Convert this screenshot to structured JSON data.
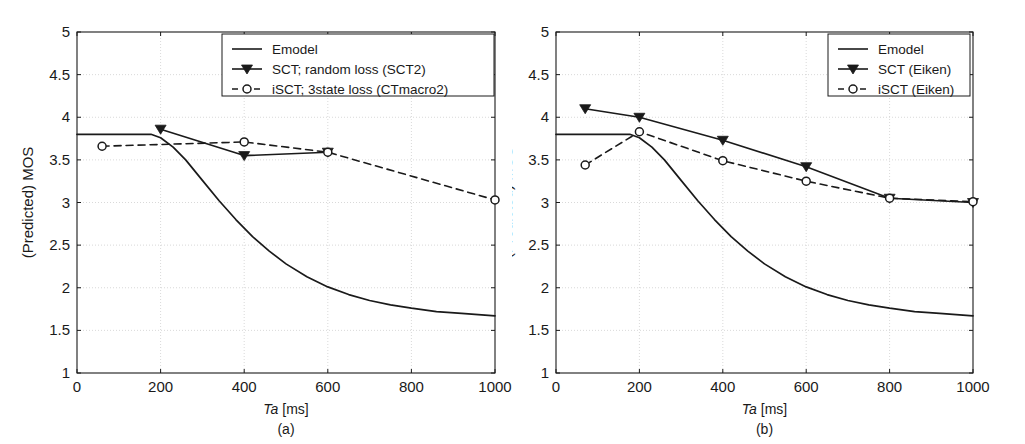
{
  "figure": {
    "background": "#ffffff",
    "ink": "#1a1a1a",
    "grid_color": "#cfcfcf",
    "panels": [
      "a",
      "b"
    ]
  },
  "panel_a": {
    "caption": "(a)",
    "xlabel_italic": "Ta",
    "xlabel_rest": " [ms]",
    "ylabel": "(Predicted) MOS",
    "xticks": [
      "0",
      "200",
      "400",
      "600",
      "800",
      "1000"
    ],
    "yticks": [
      "1",
      "1.5",
      "2",
      "2.5",
      "3",
      "3.5",
      "4",
      "4.5",
      "5"
    ],
    "legend": [
      {
        "label": "Emodel",
        "style": "solid-line"
      },
      {
        "label": "SCT; random loss (SCT2)",
        "style": "solid-line-triangle-marker"
      },
      {
        "label": "iSCT; 3state loss (CTmacro2)",
        "style": "dashed-line-circle-marker"
      }
    ]
  },
  "panel_b": {
    "caption": "(b)",
    "xlabel_italic": "Ta",
    "xlabel_rest": " [ms]",
    "ylabel": "(Predicted) MOS",
    "xticks": [
      "0",
      "200",
      "400",
      "600",
      "800",
      "1000"
    ],
    "yticks": [
      "1",
      "1.5",
      "2",
      "2.5",
      "3",
      "3.5",
      "4",
      "4.5",
      "5"
    ],
    "legend": [
      {
        "label": "Emodel",
        "style": "solid-line"
      },
      {
        "label": "SCT (Eiken)",
        "style": "solid-line-triangle-marker"
      },
      {
        "label": "iSCT (Eiken)",
        "style": "dashed-line-circle-marker"
      }
    ]
  },
  "chart_data": [
    {
      "type": "line",
      "panel": "a",
      "title": "",
      "xlabel": "Ta [ms]",
      "ylabel": "(Predicted) MOS",
      "xlim": [
        0,
        1000
      ],
      "ylim": [
        1,
        5
      ],
      "xticks": [
        0,
        200,
        400,
        600,
        800,
        1000
      ],
      "yticks": [
        1,
        1.5,
        2,
        2.5,
        3,
        3.5,
        4,
        4.5,
        5
      ],
      "grid": true,
      "legend_position": "top-center",
      "series": [
        {
          "name": "Emodel",
          "style": "solid",
          "marker": "none",
          "x": [
            0,
            50,
            100,
            150,
            177,
            200,
            230,
            260,
            300,
            340,
            380,
            420,
            460,
            500,
            550,
            600,
            650,
            700,
            750,
            800,
            860,
            920,
            1000
          ],
          "y": [
            3.8,
            3.8,
            3.8,
            3.8,
            3.8,
            3.76,
            3.65,
            3.5,
            3.26,
            3.02,
            2.8,
            2.6,
            2.43,
            2.28,
            2.13,
            2.01,
            1.92,
            1.85,
            1.8,
            1.76,
            1.72,
            1.7,
            1.67
          ]
        },
        {
          "name": "SCT; random loss (SCT2)",
          "style": "solid",
          "marker": "triangle-down-filled",
          "x": [
            200,
            400,
            600
          ],
          "y": [
            3.86,
            3.55,
            3.59
          ]
        },
        {
          "name": "iSCT; 3state loss (CTmacro2)",
          "style": "dashed",
          "marker": "circle-open",
          "x": [
            60,
            400,
            600,
            1000
          ],
          "y": [
            3.66,
            3.71,
            3.59,
            3.03
          ]
        }
      ]
    },
    {
      "type": "line",
      "panel": "b",
      "title": "",
      "xlabel": "Ta [ms]",
      "ylabel": "(Predicted) MOS",
      "xlim": [
        0,
        1000
      ],
      "ylim": [
        1,
        5
      ],
      "xticks": [
        0,
        200,
        400,
        600,
        800,
        1000
      ],
      "yticks": [
        1,
        1.5,
        2,
        2.5,
        3,
        3.5,
        4,
        4.5,
        5
      ],
      "grid": true,
      "legend_position": "top-right",
      "series": [
        {
          "name": "Emodel",
          "style": "solid",
          "marker": "none",
          "x": [
            0,
            50,
            100,
            150,
            177,
            200,
            230,
            260,
            300,
            340,
            380,
            420,
            460,
            500,
            550,
            600,
            650,
            700,
            750,
            800,
            860,
            920,
            1000
          ],
          "y": [
            3.8,
            3.8,
            3.8,
            3.8,
            3.8,
            3.76,
            3.65,
            3.5,
            3.26,
            3.02,
            2.8,
            2.6,
            2.43,
            2.28,
            2.13,
            2.01,
            1.92,
            1.85,
            1.8,
            1.76,
            1.72,
            1.7,
            1.67
          ]
        },
        {
          "name": "SCT (Eiken)",
          "style": "solid",
          "marker": "triangle-down-filled",
          "x": [
            70,
            200,
            400,
            600,
            800,
            1000
          ],
          "y": [
            4.1,
            4.0,
            3.73,
            3.42,
            3.05,
            3.0
          ]
        },
        {
          "name": "iSCT (Eiken)",
          "style": "dashed",
          "marker": "circle-open",
          "x": [
            70,
            200,
            400,
            600,
            800,
            1000
          ],
          "y": [
            3.44,
            3.83,
            3.49,
            3.25,
            3.05,
            3.01
          ]
        }
      ]
    }
  ]
}
